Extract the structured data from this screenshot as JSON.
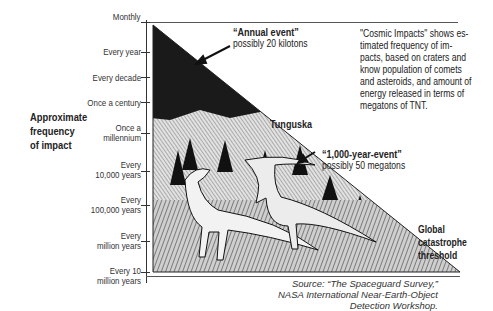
{
  "figure": {
    "title": "Cosmic Impacts",
    "description": "\"Cosmic Impacts\" shows es-\ntimated frequency of im-\npacts, based on craters and\nknow population of comets\nand asteroids, and amount of\nenergy released in terms of\nmegatons of TNT.",
    "y_axis_title": [
      "Approximate",
      "frequency",
      "of impact"
    ],
    "y_axis_ticks": [
      {
        "label": [
          "Monthly"
        ]
      },
      {
        "label": [
          "Every year"
        ]
      },
      {
        "label": [
          "Every decade"
        ]
      },
      {
        "label": [
          "Once a century"
        ]
      },
      {
        "label": [
          "Once a",
          "millennium"
        ]
      },
      {
        "label": [
          "Every",
          "10,000 years"
        ]
      },
      {
        "label": [
          "Every",
          "100,000 years"
        ]
      },
      {
        "label": [
          "Every",
          "million years"
        ]
      },
      {
        "label": [
          "Every 10",
          "million years"
        ]
      }
    ],
    "annotations": {
      "annual": {
        "title": "“Annual event”",
        "sub": "possibly 20 kilotons"
      },
      "tunguska": {
        "label": "Tunguska"
      },
      "millennial": {
        "title": "“1,000-year-event”",
        "sub": "possibly 50 megatons"
      },
      "global": {
        "lines": [
          "Global",
          "catastrophe",
          "threshold"
        ]
      }
    },
    "source": "Source: “The Spaceguard Survey,”\nNASA International Near-Earth-Object\nDetection Workshop.",
    "illustration": "dinosaurs-under-impact-triangle"
  }
}
